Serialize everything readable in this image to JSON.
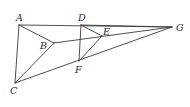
{
  "diagram": {
    "type": "geometry-figure",
    "points": {
      "A": {
        "x": 19,
        "y": 25,
        "label": "A",
        "lx": 16,
        "ly": 21
      },
      "B": {
        "x": 54,
        "y": 43,
        "label": "B",
        "lx": 40,
        "ly": 49
      },
      "C": {
        "x": 15,
        "y": 83,
        "label": "C",
        "lx": 10,
        "ly": 94
      },
      "D": {
        "x": 81,
        "y": 25,
        "label": "D",
        "lx": 78,
        "ly": 21
      },
      "E": {
        "x": 102,
        "y": 36,
        "label": "E",
        "lx": 103,
        "ly": 35
      },
      "F": {
        "x": 79,
        "y": 61,
        "label": "F",
        "lx": 75,
        "ly": 73
      },
      "G": {
        "x": 172,
        "y": 27,
        "label": "G",
        "lx": 176,
        "ly": 31
      }
    },
    "segments": [
      [
        "A",
        "G"
      ],
      [
        "A",
        "C"
      ],
      [
        "A",
        "B"
      ],
      [
        "B",
        "C"
      ],
      [
        "B",
        "G"
      ],
      [
        "C",
        "G"
      ],
      [
        "D",
        "F"
      ],
      [
        "D",
        "E"
      ],
      [
        "E",
        "F"
      ],
      [
        "D",
        "G"
      ]
    ],
    "labels": [
      "A",
      "B",
      "C",
      "D",
      "E",
      "F",
      "G"
    ]
  }
}
